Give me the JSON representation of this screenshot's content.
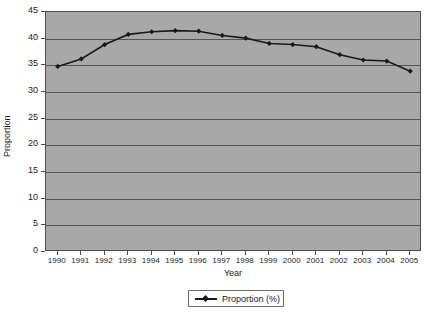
{
  "chart_data": {
    "type": "line",
    "title": "",
    "xlabel": "Year",
    "ylabel": "Proportion",
    "categories": [
      "1990",
      "1991",
      "1992",
      "1993",
      "1994",
      "1995",
      "1996",
      "1997",
      "1998",
      "1999",
      "2000",
      "2001",
      "2002",
      "2003",
      "2004",
      "2005"
    ],
    "series": [
      {
        "name": "Proportion (%)",
        "values": [
          34.8,
          36.2,
          38.9,
          40.8,
          41.3,
          41.5,
          41.4,
          40.6,
          40.1,
          39.1,
          38.9,
          38.5,
          37.0,
          36.0,
          35.8,
          33.9
        ]
      }
    ],
    "ylim": [
      0,
      45
    ],
    "ytick_step": 5,
    "yticks": [
      "45",
      "40",
      "35",
      "30",
      "25",
      "20",
      "15",
      "10",
      "5",
      "0"
    ],
    "grid": true,
    "legend_position": "bottom",
    "marker": "diamond",
    "colors": {
      "plot_background": "#a8a8a8",
      "page_background": "#ffffff",
      "gridline": "#555555",
      "axis": "#4d4d4d",
      "series_line": "#1a1a1a",
      "text": "#1a1a1a",
      "legend_border": "#707070"
    }
  },
  "legend": {
    "entries": [
      {
        "label": "Proportion (%)"
      }
    ]
  }
}
